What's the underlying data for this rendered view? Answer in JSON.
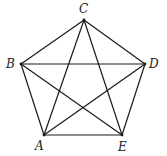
{
  "diagram": {
    "type": "complete-graph-pentagon",
    "vertices": [
      {
        "id": "A",
        "label": "A",
        "x": 44,
        "y": 135,
        "lx": 35,
        "ly": 150
      },
      {
        "id": "B",
        "label": "B",
        "x": 21,
        "y": 64,
        "lx": 6,
        "ly": 68
      },
      {
        "id": "C",
        "label": "C",
        "x": 84,
        "y": 20,
        "lx": 79,
        "ly": 13
      },
      {
        "id": "D",
        "label": "D",
        "x": 145,
        "y": 64,
        "lx": 149,
        "ly": 68
      },
      {
        "id": "E",
        "label": "E",
        "x": 122,
        "y": 135,
        "lx": 118,
        "ly": 151
      }
    ],
    "edges": [
      [
        "A",
        "B"
      ],
      [
        "A",
        "C"
      ],
      [
        "A",
        "D"
      ],
      [
        "A",
        "E"
      ],
      [
        "B",
        "C"
      ],
      [
        "B",
        "D"
      ],
      [
        "B",
        "E"
      ],
      [
        "C",
        "D"
      ],
      [
        "C",
        "E"
      ],
      [
        "D",
        "E"
      ]
    ]
  }
}
